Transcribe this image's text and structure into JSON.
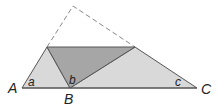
{
  "diagram": {
    "type": "geometry-folded-triangle",
    "colors": {
      "light_fill": "#d9d9d9",
      "dark_fill": "#a6a6a6",
      "stroke": "#555555",
      "dashed_stroke": "#888888"
    },
    "vertices": {
      "A": "A",
      "B": "B",
      "C": "C"
    },
    "angles": {
      "a": "a",
      "b": "b",
      "c": "c"
    }
  }
}
